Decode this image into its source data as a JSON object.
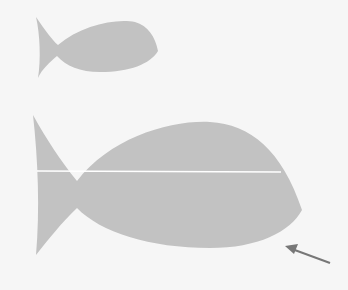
{
  "figure": {
    "fish_color": "#c2c2c2",
    "line_color": "#ffffff",
    "arrow_color": "#777777",
    "background": "#f6f6f6"
  },
  "small_fish": {
    "label": "small-fish"
  },
  "large_fish": {
    "label": "large-fish"
  },
  "arrow": {
    "label": "arrow"
  }
}
